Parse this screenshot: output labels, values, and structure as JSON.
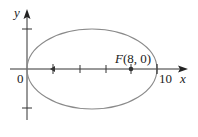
{
  "diagram": {
    "type": "ellipse-on-axes",
    "axes": {
      "x_label": "x",
      "y_label": "y",
      "origin_label": "0",
      "x_tick_label": "10"
    },
    "ellipse": {
      "left_vertex": [
        0,
        0
      ],
      "right_vertex": [
        10,
        0
      ],
      "center": [
        5,
        0
      ],
      "semi_major": 5,
      "semi_minor": 3
    },
    "focus": {
      "label": "F(8, 0)",
      "point": [
        8,
        0
      ]
    },
    "other_focus": [
      2,
      0
    ],
    "x_ticks": [
      2,
      4,
      6,
      8,
      10
    ],
    "y_ticks": [
      3,
      -3
    ],
    "colors": {
      "axes": "#333333",
      "ellipse": "#888888",
      "text": "#222222"
    }
  }
}
